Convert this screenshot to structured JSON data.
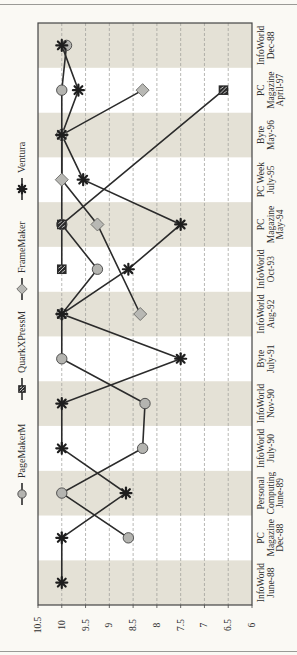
{
  "chart_data": {
    "type": "line",
    "orientation": "rotated-90-ccw",
    "title": "",
    "xlabel": "",
    "ylabel": "",
    "ylim": [
      6,
      10.5
    ],
    "yticks": [
      "10.5",
      "10",
      "9.5",
      "9",
      "8.5",
      "8",
      "7.5",
      "7",
      "6.5",
      "6"
    ],
    "ytick_values": [
      10.5,
      10,
      9.5,
      9,
      8.5,
      8,
      7.5,
      7,
      6.5,
      6
    ],
    "grid": "dashed",
    "band_colors": [
      "#e4e1d6",
      "#ffffff"
    ],
    "legend_position": "left (rotated, along top of plot)",
    "categories": [
      [
        "InfoWorld",
        "June-88"
      ],
      [
        "PC",
        "Magazine",
        "Dec-88"
      ],
      [
        "Personal",
        "Computing",
        "June-89"
      ],
      [
        "InfoWorld",
        "July-90"
      ],
      [
        "InfoWorld",
        "Nov-90"
      ],
      [
        "Byte",
        "July-91"
      ],
      [
        "InfoWorld",
        "Aug-92"
      ],
      [
        "InfoWorld",
        "Oct-93"
      ],
      [
        "PC",
        "Magazine",
        "May-94"
      ],
      [
        "PC Week",
        "July-95"
      ],
      [
        "Byte",
        "May-96"
      ],
      [
        "PC",
        "Magazine",
        "April-97"
      ],
      [
        "InfoWorld",
        "Dec-88"
      ]
    ],
    "series": [
      {
        "name": "PageMakerM",
        "marker": "circle",
        "values": [
          null,
          8.6,
          10,
          8.3,
          8.25,
          10,
          10,
          9.25,
          10,
          null,
          10,
          10,
          9.9
        ]
      },
      {
        "name": "QuarkXPressM",
        "marker": "square",
        "values": [
          null,
          null,
          null,
          null,
          null,
          null,
          null,
          10,
          10,
          null,
          null,
          6.6,
          null
        ]
      },
      {
        "name": "FrameMaker",
        "marker": "diamond",
        "values": [
          null,
          null,
          null,
          null,
          null,
          null,
          8.35,
          null,
          9.25,
          10,
          10,
          8.3,
          null
        ]
      },
      {
        "name": "Ventura",
        "marker": "asterisk",
        "values": [
          10,
          10,
          8.65,
          10,
          10,
          7.5,
          10,
          8.6,
          7.5,
          9.55,
          10,
          9.65,
          10
        ]
      }
    ]
  },
  "legend": [
    {
      "name": "PageMakerM",
      "marker": "circle"
    },
    {
      "name": "QuarkXPressM",
      "marker": "square"
    },
    {
      "name": "FrameMaker",
      "marker": "diamond"
    },
    {
      "name": "Ventura",
      "marker": "asterisk"
    }
  ]
}
